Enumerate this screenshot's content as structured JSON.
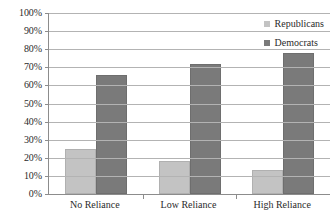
{
  "chart_data": {
    "type": "bar",
    "title": "",
    "xlabel": "",
    "ylabel": "",
    "ylim": [
      0,
      100
    ],
    "grid": true,
    "legend_position": "top-right-inside",
    "categories": [
      "No Reliance",
      "Low Reliance",
      "High Reliance"
    ],
    "y_ticks": [
      "0%",
      "10%",
      "20%",
      "30%",
      "40%",
      "50%",
      "60%",
      "70%",
      "80%",
      "90%",
      "100%"
    ],
    "y_tick_values": [
      0,
      10,
      20,
      30,
      40,
      50,
      60,
      70,
      80,
      90,
      100
    ],
    "series": [
      {
        "name": "Republicans",
        "color": "#c3c3c3",
        "values": [
          25,
          18,
          13
        ]
      },
      {
        "name": "Democrats",
        "color": "#7a7a7a",
        "values": [
          66,
          72,
          78
        ]
      }
    ]
  }
}
